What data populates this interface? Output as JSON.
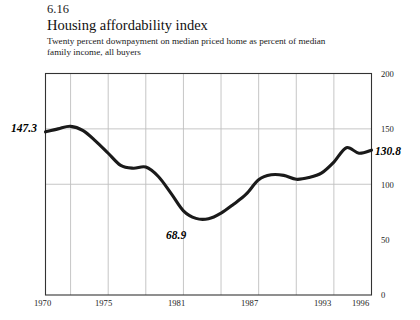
{
  "figure": {
    "number": "6.16",
    "title": "Housing affordability index",
    "subtitle": "Twenty percent downpayment on median priced home as percent of median family income, all buyers"
  },
  "annotations": {
    "start_value": "147.3",
    "end_value": "130.8",
    "min_value": "68.9"
  },
  "chart_data": {
    "type": "line",
    "title": "Housing affordability index",
    "subtitle": "Twenty percent downpayment on median priced home as percent of median family income, all buyers",
    "xlabel": "",
    "ylabel": "",
    "xlim": [
      1970,
      1996
    ],
    "ylim": [
      0,
      200
    ],
    "yticks": [
      0,
      50,
      100,
      150,
      200
    ],
    "ytick_labels": [
      "0",
      "50",
      "100",
      "150",
      "200"
    ],
    "xticks": [
      1970,
      1975,
      1981,
      1987,
      1993,
      1996
    ],
    "xtick_labels": [
      "1970",
      "1975",
      "1981",
      "1987",
      "1993",
      "1996"
    ],
    "gridlines": {
      "horizontal_at": [
        150,
        100
      ],
      "vertical_at": [
        1972,
        1975,
        1978,
        1981,
        1984,
        1987,
        1990,
        1993
      ],
      "grid": true
    },
    "legend": null,
    "series": [
      {
        "name": "Housing affordability index",
        "color": "#1a1a1a",
        "x": [
          1970,
          1971,
          1972,
          1973,
          1974,
          1975,
          1976,
          1977,
          1978,
          1979,
          1980,
          1981,
          1982,
          1983,
          1984,
          1985,
          1986,
          1987,
          1988,
          1989,
          1990,
          1991,
          1992,
          1993,
          1994,
          1995,
          1996
        ],
        "values": [
          147.3,
          150.0,
          152.3,
          148.5,
          139.0,
          128.0,
          117.0,
          114.5,
          115.5,
          107.0,
          92.0,
          76.0,
          69.2,
          68.9,
          74.0,
          82.0,
          91.0,
          104.0,
          108.5,
          108.0,
          104.5,
          106.0,
          110.0,
          120.0,
          133.0,
          128.0,
          130.8
        ]
      }
    ],
    "annotated_points": [
      {
        "x": 1970,
        "y": 147.3,
        "label": "147.3",
        "position": "left"
      },
      {
        "x": 1983,
        "y": 68.9,
        "label": "68.9",
        "position": "below"
      },
      {
        "x": 1996,
        "y": 130.8,
        "label": "130.8",
        "position": "right"
      }
    ]
  }
}
